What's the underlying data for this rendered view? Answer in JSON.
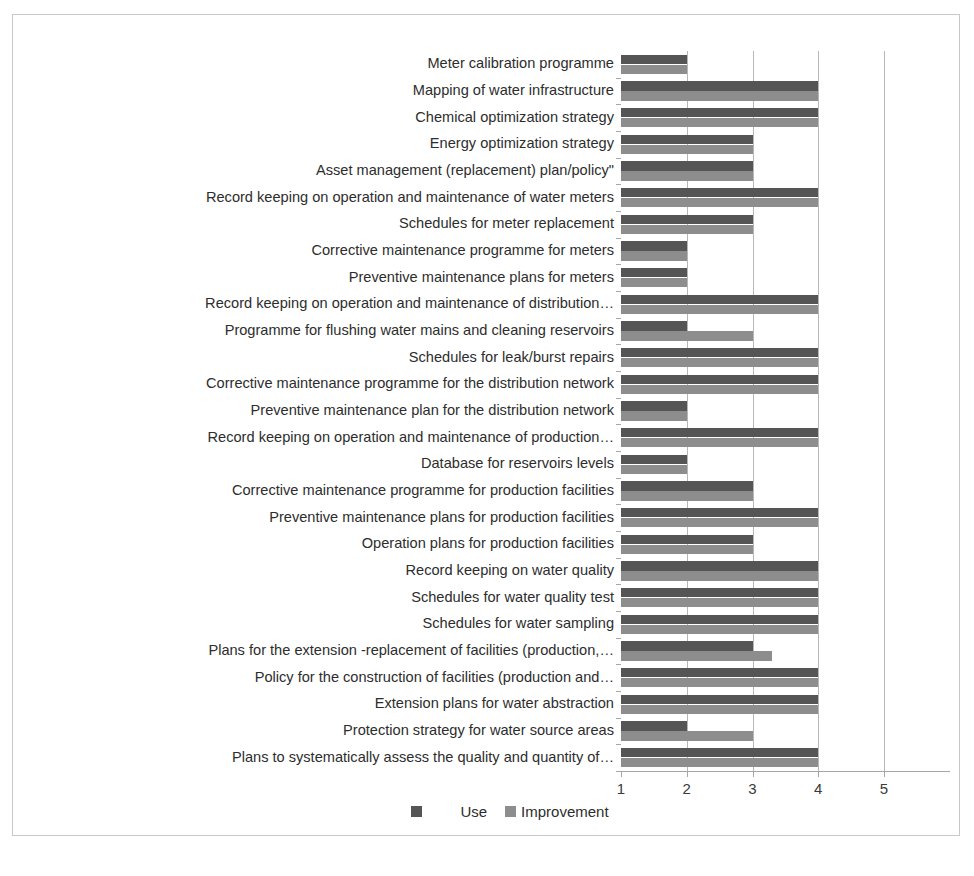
{
  "chart_data": {
    "type": "bar",
    "orientation": "horizontal",
    "title": "",
    "xlabel": "",
    "ylabel": "",
    "xlim": [
      1,
      5
    ],
    "xticks": [
      "1",
      "2",
      "3",
      "4",
      "5"
    ],
    "grid": true,
    "legend_position": "bottom",
    "series": [
      {
        "name": "Use",
        "color": "#555555",
        "values": [
          2,
          4,
          4,
          3,
          3,
          4,
          3,
          2,
          2,
          4,
          2,
          4,
          4,
          2,
          4,
          2,
          3,
          4,
          3,
          4,
          4,
          4,
          3,
          4,
          4,
          2,
          4
        ]
      },
      {
        "name": "Improvement",
        "color": "#8d8d8d",
        "values": [
          2,
          4,
          4,
          3,
          3,
          4,
          3,
          2,
          2,
          4,
          3,
          4,
          4,
          2,
          4,
          2,
          3,
          4,
          3,
          4,
          4,
          4,
          3.3,
          4,
          4,
          3,
          4
        ]
      }
    ],
    "categories": [
      "Meter calibration programme",
      "Mapping of water infrastructure",
      "Chemical optimization strategy",
      "Energy optimization strategy",
      "Asset management (replacement) plan/policy\"",
      "Record keeping on operation and maintenance of water meters",
      "Schedules for meter replacement",
      "Corrective maintenance programme for meters",
      "Preventive maintenance plans for meters",
      "Record keeping on operation and maintenance of distribution…",
      "Programme for flushing water mains and cleaning reservoirs",
      "Schedules for leak/burst repairs",
      "Corrective maintenance programme for the distribution network",
      "Preventive   maintenance plan for the distribution network",
      "Record keeping on operation and maintenance of production…",
      "Database for reservoirs levels",
      "Corrective maintenance programme for  production facilities",
      "Preventive maintenance plans for production facilities",
      "Operation plans for production facilities",
      "Record keeping on water quality",
      "Schedules for water quality test",
      "Schedules for water sampling",
      "Plans for the extension -replacement of facilities (production,…",
      "Policy for the construction of facilities (production and…",
      "Extension plans for water abstraction",
      "Protection strategy for water source areas",
      "Plans to systematically assess the  quality and quantity of…"
    ]
  },
  "legend": {
    "use_label": "Use",
    "improvement_label": "Improvement"
  },
  "colors": {
    "use": "#555555",
    "improvement": "#8d8d8d",
    "axis": "#a6a6a6",
    "gridline": "#b7b7b7",
    "border": "#c9c9c9",
    "background": "#ffffff"
  }
}
